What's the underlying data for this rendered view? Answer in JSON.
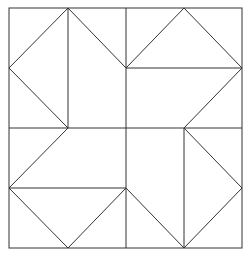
{
  "diagram": {
    "title": "",
    "stroke_color": "#333333",
    "background": "#ffffff",
    "outer_square": {
      "x": 9,
      "y": 8,
      "width": 233,
      "height": 240
    },
    "lines": [
      {
        "id": "mid-vertical",
        "x1": 126,
        "y1": 8,
        "x2": 126,
        "y2": 248
      },
      {
        "id": "mid-horizontal",
        "x1": 9,
        "y1": 128,
        "x2": 242,
        "y2": 128
      },
      {
        "id": "tl-vertical",
        "x1": 68,
        "y1": 8,
        "x2": 68,
        "y2": 128
      },
      {
        "id": "tl-diag-1",
        "x1": 68,
        "y1": 8,
        "x2": 9,
        "y2": 68
      },
      {
        "id": "tl-diag-2",
        "x1": 9,
        "y1": 68,
        "x2": 68,
        "y2": 128
      },
      {
        "id": "tl-diag-3",
        "x1": 68,
        "y1": 8,
        "x2": 126,
        "y2": 68
      },
      {
        "id": "tr-horizontal",
        "x1": 126,
        "y1": 68,
        "x2": 242,
        "y2": 68
      },
      {
        "id": "tr-diag-1",
        "x1": 126,
        "y1": 68,
        "x2": 184,
        "y2": 8
      },
      {
        "id": "tr-diag-2",
        "x1": 184,
        "y1": 8,
        "x2": 242,
        "y2": 68
      },
      {
        "id": "tr-diag-3",
        "x1": 242,
        "y1": 68,
        "x2": 184,
        "y2": 128
      },
      {
        "id": "bl-diag-1",
        "x1": 68,
        "y1": 128,
        "x2": 9,
        "y2": 188
      },
      {
        "id": "bl-horizontal",
        "x1": 9,
        "y1": 188,
        "x2": 126,
        "y2": 188
      },
      {
        "id": "bl-diag-2",
        "x1": 9,
        "y1": 188,
        "x2": 68,
        "y2": 248
      },
      {
        "id": "bl-diag-3",
        "x1": 68,
        "y1": 248,
        "x2": 126,
        "y2": 188
      },
      {
        "id": "br-vertical",
        "x1": 184,
        "y1": 128,
        "x2": 184,
        "y2": 248
      },
      {
        "id": "br-diag-1",
        "x1": 184,
        "y1": 128,
        "x2": 242,
        "y2": 188
      },
      {
        "id": "br-diag-2",
        "x1": 242,
        "y1": 188,
        "x2": 184,
        "y2": 248
      },
      {
        "id": "br-diag-3",
        "x1": 126,
        "y1": 188,
        "x2": 184,
        "y2": 248
      }
    ]
  }
}
